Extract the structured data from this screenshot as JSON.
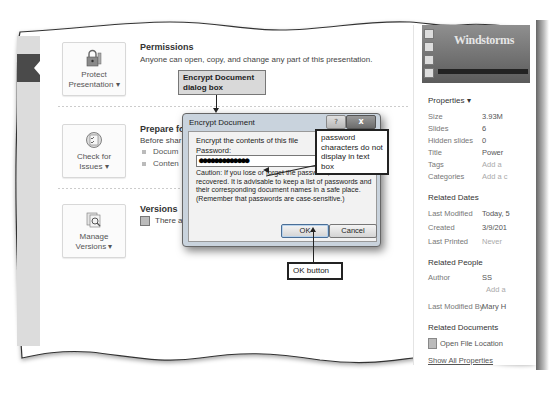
{
  "backstage": {
    "sections": [
      {
        "button_label_line1": "Protect",
        "button_label_line2": "Presentation",
        "button_icon": "lock-key-icon",
        "title": "Permissions",
        "text": "Anyone can open, copy, and change any part of this presentation."
      },
      {
        "button_label_line1": "Check for",
        "button_label_line2": "Issues",
        "button_icon": "checklist-icon",
        "title": "Prepare fo",
        "text": "Before shar",
        "bullets": [
          "Docum",
          "Conten"
        ]
      },
      {
        "button_label_line1": "Manage",
        "button_label_line2": "Versions",
        "button_icon": "versions-icon",
        "title": "Versions",
        "text": "There a"
      }
    ],
    "dropdown_marker": "▾"
  },
  "right_panel": {
    "thumbnail_title": "Windstorms",
    "properties_header": "Properties ▾",
    "properties": [
      {
        "key": "Size",
        "value": "3.93M"
      },
      {
        "key": "Slides",
        "value": "6"
      },
      {
        "key": "Hidden slides",
        "value": "0"
      },
      {
        "key": "Title",
        "value": "Power"
      },
      {
        "key": "Tags",
        "value": "Add a",
        "muted": true
      },
      {
        "key": "Categories",
        "value": "Add a c",
        "muted": true
      }
    ],
    "related_dates_header": "Related Dates",
    "related_dates": [
      {
        "key": "Last Modified",
        "value": "Today, 5"
      },
      {
        "key": "Created",
        "value": "3/9/201"
      },
      {
        "key": "Last Printed",
        "value": "Never",
        "muted": true
      }
    ],
    "related_people_header": "Related People",
    "author_key": "Author",
    "author_value": "SS",
    "add_author": "Add a",
    "last_modified_by_key": "Last Modified By",
    "last_modified_by_value": "Mary H",
    "related_documents_header": "Related Documents",
    "open_file_location": "Open File Location",
    "show_all_properties": "Show All Properties"
  },
  "dialog": {
    "title": "Encrypt Document",
    "help_label": "?",
    "close_label": "x",
    "instruction": "Encrypt the contents of this file",
    "password_label": "Password:",
    "password_value": "●●●●●●●●●●●●●",
    "caution": "Caution: If you lose or forget the password, it cannot be recovered. It is advisable to keep a list of passwords and their corresponding document names in a safe place. (Remember that passwords are case-sensitive.)",
    "ok_label": "OK",
    "cancel_label": "Cancel"
  },
  "callouts": {
    "dialog_box": "Encrypt Document dialog box",
    "password_note": "password characters do not display in text box",
    "ok_button": "OK button"
  }
}
